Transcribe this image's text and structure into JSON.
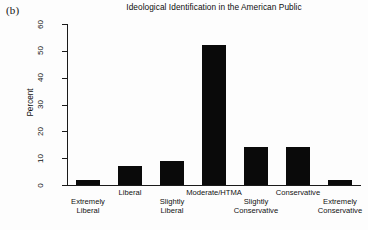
{
  "figure": {
    "panel_label": "(b)",
    "title": "Ideological Identification in the American Public",
    "background_color": "#ffffff",
    "bar_color": "#0a0a0a",
    "axis_color": "#1a1a1a"
  },
  "chart_data": {
    "type": "bar",
    "title": "Ideological Identification in the American Public",
    "xlabel": "",
    "ylabel": "Percent",
    "ylim": [
      0,
      62
    ],
    "yticks": [
      0,
      10,
      20,
      30,
      40,
      50,
      60
    ],
    "ytick_labels": [
      "0",
      "10",
      "20",
      "30",
      "40",
      "50",
      "60"
    ],
    "grid": false,
    "legend": false,
    "categories": [
      "Extremely Liberal",
      "Liberal",
      "Slightly Liberal",
      "Moderate/HTMA",
      "Slightly Conservative",
      "Conservative",
      "Extremely Conservative"
    ],
    "category_label_lines": [
      [
        "Extremely",
        "Liberal"
      ],
      [
        "Liberal"
      ],
      [
        "Slightly",
        "Liberal"
      ],
      [
        "Moderate/HTMA"
      ],
      [
        "Slightly",
        "Conservative"
      ],
      [
        "Conservative"
      ],
      [
        "Extremely",
        "Conservative"
      ]
    ],
    "values": [
      2,
      7,
      9,
      52,
      14,
      14,
      2
    ]
  }
}
